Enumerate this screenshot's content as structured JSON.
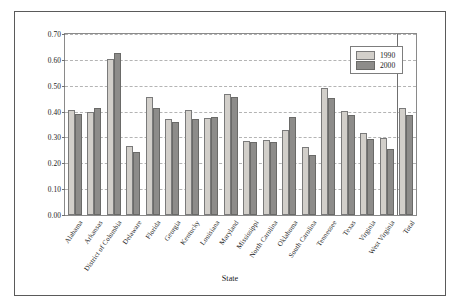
{
  "chart_data": {
    "type": "bar",
    "title": "",
    "xlabel": "State",
    "ylabel": "Segregation Level (H)",
    "ylabel_plain": "Segregation Level",
    "ylabel_italic": "H",
    "ylim": [
      0.0,
      0.7
    ],
    "ytick_step": 0.1,
    "ytick_labels": [
      "0.00",
      "0.10",
      "0.20",
      "0.30",
      "0.40",
      "0.50",
      "0.60",
      "0.70"
    ],
    "ytick_values": [
      0.0,
      0.1,
      0.2,
      0.3,
      0.4,
      0.5,
      0.6,
      0.7
    ],
    "grid": true,
    "grid_style": "dashed-horizontal",
    "legend_position": "top-right-inside",
    "separator_before_category": "Total",
    "categories": [
      "Alabama",
      "Arkansas",
      "District of Columbia",
      "Delaware",
      "Florida",
      "Georgia",
      "Kentucky",
      "Louisiana",
      "Maryland",
      "Mississippi",
      "North Carolina",
      "Oklahoma",
      "South Carolina",
      "Tennessee",
      "Texas",
      "Virginia",
      "West Virginia",
      "Total"
    ],
    "series": [
      {
        "name": "1990",
        "color": "#d2cfca",
        "values": [
          0.405,
          0.4,
          0.603,
          0.265,
          0.457,
          0.371,
          0.407,
          0.376,
          0.468,
          0.288,
          0.29,
          0.327,
          0.262,
          0.49,
          0.401,
          0.316,
          0.299,
          0.415
        ]
      },
      {
        "name": "2000",
        "color": "#8d8c8a",
        "values": [
          0.39,
          0.412,
          0.625,
          0.242,
          0.412,
          0.359,
          0.371,
          0.378,
          0.455,
          0.284,
          0.283,
          0.38,
          0.232,
          0.452,
          0.385,
          0.294,
          0.256,
          0.387
        ]
      }
    ]
  },
  "legend": {
    "entries": [
      {
        "label": "1990",
        "swatch": "light-gray"
      },
      {
        "label": "2000",
        "swatch": "dark-gray"
      }
    ]
  },
  "axes": {
    "x_title": "State",
    "y_title_prefix": "Segregation Level (",
    "y_title_italic": "H",
    "y_title_suffix": ")"
  }
}
